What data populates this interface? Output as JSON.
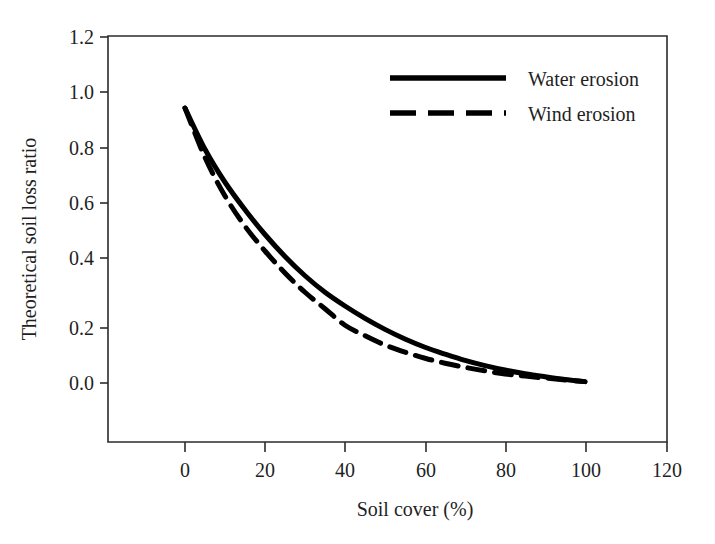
{
  "chart_data": {
    "type": "line",
    "title": "",
    "subtitle": "",
    "xlabel": "Soil cover (%)",
    "ylabel": "Theoretical soil loss ratio",
    "xlim": [
      -19,
      120
    ],
    "ylim": [
      -0.21,
      1.2
    ],
    "grid": false,
    "legend_position": "top-right",
    "x_ticks": [
      "0",
      "20",
      "40",
      "60",
      "80",
      "100",
      "120"
    ],
    "x_tick_values": [
      0,
      20,
      40,
      60,
      80,
      100,
      120
    ],
    "y_ticks": [
      "0.0",
      "0.2",
      "0.4",
      "0.6",
      "0.8",
      "1.0",
      "1.2"
    ],
    "y_tick_values": [
      0.0,
      0.2,
      0.4,
      0.6,
      0.8,
      1.0,
      1.2
    ],
    "x": [
      0,
      5,
      10,
      15,
      20,
      25,
      30,
      35,
      40,
      45,
      50,
      55,
      60,
      65,
      70,
      75,
      80,
      85,
      90,
      95,
      100
    ],
    "series": [
      {
        "name": "Water erosion",
        "style": "solid",
        "color": "#000000",
        "values": [
          1.0,
          0.85,
          0.73,
          0.63,
          0.54,
          0.46,
          0.39,
          0.33,
          0.28,
          0.235,
          0.195,
          0.16,
          0.13,
          0.105,
          0.082,
          0.063,
          0.047,
          0.034,
          0.023,
          0.013,
          0.005
        ]
      },
      {
        "name": "Wind erosion",
        "style": "dashed",
        "color": "#000000",
        "values": [
          1.0,
          0.82,
          0.68,
          0.57,
          0.48,
          0.4,
          0.33,
          0.27,
          0.21,
          0.172,
          0.138,
          0.112,
          0.09,
          0.072,
          0.057,
          0.044,
          0.033,
          0.025,
          0.018,
          0.011,
          0.005
        ]
      }
    ]
  },
  "legend": {
    "entries": [
      {
        "label": "Water erosion",
        "style": "solid"
      },
      {
        "label": "Wind erosion",
        "style": "dashed"
      }
    ]
  },
  "axes": {
    "x_title": "Soil cover (%)",
    "y_title": "Theoretical soil loss ratio"
  }
}
